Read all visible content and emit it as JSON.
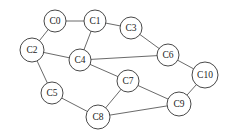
{
  "diagram": {
    "type": "undirected-graph",
    "nodes": [
      {
        "id": "C0",
        "label": "C0",
        "x": 55,
        "y": 21,
        "r": 11
      },
      {
        "id": "C1",
        "label": "C1",
        "x": 95,
        "y": 21,
        "r": 11
      },
      {
        "id": "C3",
        "label": "C3",
        "x": 131,
        "y": 28,
        "r": 11
      },
      {
        "id": "C2",
        "label": "C2",
        "x": 32,
        "y": 50,
        "r": 12
      },
      {
        "id": "C4",
        "label": "C4",
        "x": 80,
        "y": 60,
        "r": 11
      },
      {
        "id": "C6",
        "label": "C6",
        "x": 168,
        "y": 55,
        "r": 11
      },
      {
        "id": "C10",
        "label": "C10",
        "x": 205,
        "y": 75,
        "r": 13
      },
      {
        "id": "C7",
        "label": "C7",
        "x": 128,
        "y": 81,
        "r": 11
      },
      {
        "id": "C5",
        "label": "C5",
        "x": 52,
        "y": 93,
        "r": 11
      },
      {
        "id": "C9",
        "label": "C9",
        "x": 179,
        "y": 104,
        "r": 12
      },
      {
        "id": "C8",
        "label": "C8",
        "x": 98,
        "y": 117,
        "r": 12
      }
    ],
    "edges": [
      [
        "C0",
        "C1"
      ],
      [
        "C0",
        "C2"
      ],
      [
        "C1",
        "C3"
      ],
      [
        "C1",
        "C4"
      ],
      [
        "C2",
        "C4"
      ],
      [
        "C2",
        "C5"
      ],
      [
        "C3",
        "C6"
      ],
      [
        "C4",
        "C6"
      ],
      [
        "C4",
        "C7"
      ],
      [
        "C6",
        "C10"
      ],
      [
        "C7",
        "C8"
      ],
      [
        "C7",
        "C9"
      ],
      [
        "C5",
        "C8"
      ],
      [
        "C8",
        "C9"
      ],
      [
        "C9",
        "C10"
      ]
    ]
  }
}
